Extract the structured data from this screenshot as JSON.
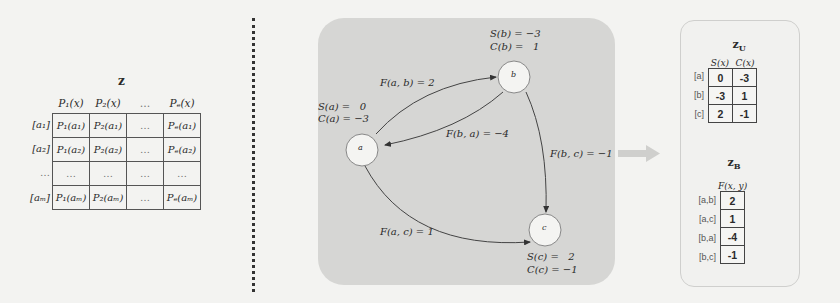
{
  "matrix_z": {
    "title": "z",
    "columns": [
      "P₁(x)",
      "P₂(x)",
      "…",
      "Pₑ(x)"
    ],
    "rows": [
      {
        "label": "[a₁]",
        "cells": [
          "P₁(a₁)",
          "P₂(a₁)",
          "…",
          "Pₑ(a₁)"
        ]
      },
      {
        "label": "[a₂]",
        "cells": [
          "P₁(a₂)",
          "P₂(a₂)",
          "…",
          "Pₑ(a₂)"
        ]
      },
      {
        "label": "…",
        "cells": [
          "…",
          "…",
          "…",
          "…"
        ]
      },
      {
        "label": "[aₘ]",
        "cells": [
          "P₁(aₘ)",
          "P₂(aₘ)",
          "…",
          "Pₑ(aₘ)"
        ]
      }
    ]
  },
  "graph": {
    "nodes": {
      "a": {
        "label": "a",
        "s": "S(a) =   0",
        "c": "C(a) = −3"
      },
      "b": {
        "label": "b",
        "s": "S(b) = −3",
        "c": "C(b) =   1"
      },
      "c": {
        "label": "c",
        "s": "S(c) =   2",
        "c": "C(c) = −1"
      }
    },
    "edges": {
      "ab": "F(a, b) = 2",
      "ba": "F(b, a) = −4",
      "bc": "F(b, c) = −1",
      "ac": "F(a, c) = 1"
    }
  },
  "table_zU": {
    "title": "z",
    "subscript": "U",
    "columns": [
      "S(x)",
      "C(x)"
    ],
    "rows": [
      {
        "label": "[a]",
        "values": [
          "0",
          "-3"
        ]
      },
      {
        "label": "[b]",
        "values": [
          "-3",
          "1"
        ]
      },
      {
        "label": "[c]",
        "values": [
          "2",
          "-1"
        ]
      }
    ]
  },
  "table_zB": {
    "title": "z",
    "subscript": "B",
    "columns": [
      "F(x, y)"
    ],
    "rows": [
      {
        "label": "[a,b]",
        "values": [
          "2"
        ]
      },
      {
        "label": "[a,c]",
        "values": [
          "1"
        ]
      },
      {
        "label": "[b,a]",
        "values": [
          "-4"
        ]
      },
      {
        "label": "[b,c]",
        "values": [
          "-1"
        ]
      }
    ]
  },
  "colors": {
    "panel_gray": "#d6d6d4",
    "node_fill": "#f4f4f2",
    "edge": "#333333",
    "arrow": "#c4c4c2"
  }
}
